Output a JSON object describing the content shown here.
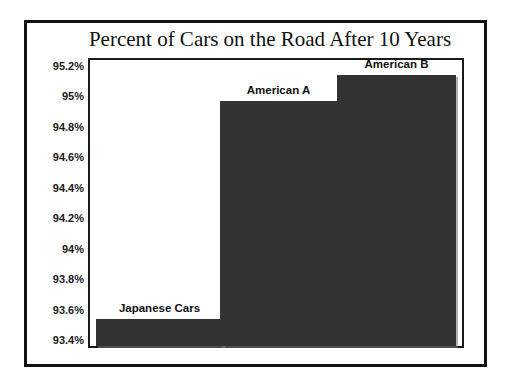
{
  "chart_data": {
    "type": "bar",
    "title": "Percent of Cars on the Road After 10 Years",
    "xlabel": "",
    "ylabel": "",
    "categories": [
      "Japanese Cars",
      "American A",
      "American B"
    ],
    "values": [
      93.54,
      94.97,
      95.14
    ],
    "ylim": [
      93.35,
      95.25
    ],
    "y_ticks": [
      "95.2%",
      "95%",
      "94.8%",
      "94.6%",
      "94.4%",
      "94.2%",
      "94%",
      "93.8%",
      "93.6%",
      "93.4%"
    ],
    "y_tick_values": [
      95.2,
      95.0,
      94.8,
      94.6,
      94.4,
      94.2,
      94.0,
      93.8,
      93.6,
      93.4
    ],
    "grid": false,
    "legend": "none",
    "bar_color": "#333333",
    "axis_color": "#1a1a1a",
    "background_color": "#ffffff",
    "bar_labels_position": "above-bar"
  },
  "figure": {
    "frame_color": "#111111",
    "title_font": "serif"
  }
}
